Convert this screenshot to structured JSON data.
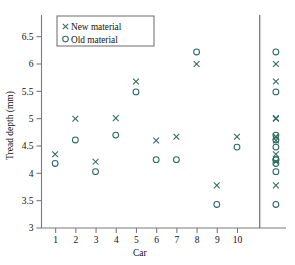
{
  "chart_data": {
    "type": "scatter",
    "title": "",
    "xlabel": "Car",
    "ylabel": "Tread depth (mm)",
    "xlim": [
      0.3,
      12.4
    ],
    "ylim": [
      3,
      6.75
    ],
    "xticks": [
      "1",
      "2",
      "3",
      "4",
      "5",
      "6",
      "7",
      "8",
      "9",
      "10"
    ],
    "xtick_values": [
      1,
      2,
      3,
      4,
      5,
      6,
      7,
      8,
      9,
      10
    ],
    "yticks": [
      "3",
      "3.5",
      "4",
      "4.5",
      "5",
      "5.5",
      "6",
      "6.5"
    ],
    "ytick_values": [
      3,
      3.5,
      4,
      4.5,
      5,
      5.5,
      6,
      6.5
    ],
    "grid": false,
    "legend_position": "upper-left",
    "marker_color": "#2d6b5f",
    "categories": [
      1,
      2,
      3,
      4,
      5,
      6,
      7,
      8,
      9,
      10
    ],
    "series": [
      {
        "name": "New material",
        "marker": "x",
        "values": [
          4.35,
          5.0,
          4.21,
          5.01,
          5.68,
          4.6,
          4.67,
          6.0,
          3.78,
          4.67
        ]
      },
      {
        "name": "Old material",
        "marker": "o",
        "values": [
          4.18,
          4.61,
          4.03,
          4.7,
          5.49,
          4.25,
          4.25,
          6.22,
          3.43,
          4.48
        ]
      }
    ],
    "marginal_column": {
      "label": "",
      "x_position": 11.9,
      "new_material": [
        4.35,
        5.0,
        4.21,
        5.01,
        5.68,
        4.6,
        4.67,
        6.0,
        3.78,
        4.67
      ],
      "old_material": [
        4.18,
        4.61,
        4.03,
        4.7,
        5.49,
        4.25,
        4.25,
        6.22,
        3.43,
        4.48
      ]
    }
  },
  "legend": {
    "entries": [
      {
        "label": "New material",
        "marker": "x"
      },
      {
        "label": "Old material",
        "marker": "o"
      }
    ]
  }
}
